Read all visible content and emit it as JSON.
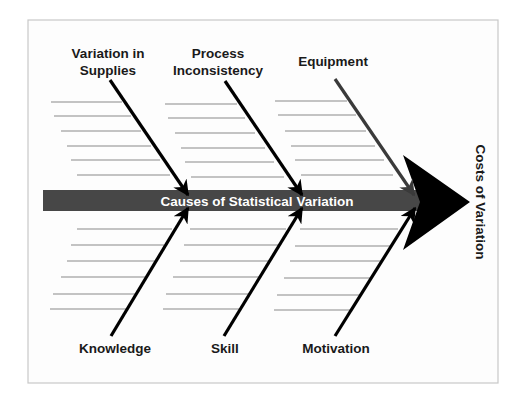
{
  "diagram": {
    "type": "fishbone",
    "spine_label": "Causes of Statistical Variation",
    "effect_label": "Costs of Variation",
    "colors": {
      "frame_border": "#c8c8c8",
      "spine": "#474747",
      "head": "#000000",
      "arrow": "#000000",
      "equipment_arrow": "#3a3a3a",
      "rib_lines": "#8a8a8a",
      "text": "#1a1a1a",
      "spine_text": "#ffffff"
    },
    "top_causes": [
      {
        "line1": "Variation in",
        "line2": "Supplies"
      },
      {
        "line1": "Process",
        "line2": "Inconsistency"
      },
      {
        "line1": "Equipment",
        "line2": ""
      }
    ],
    "bottom_causes": [
      {
        "label": "Knowledge"
      },
      {
        "label": "Skill"
      },
      {
        "label": "Motivation"
      }
    ]
  }
}
